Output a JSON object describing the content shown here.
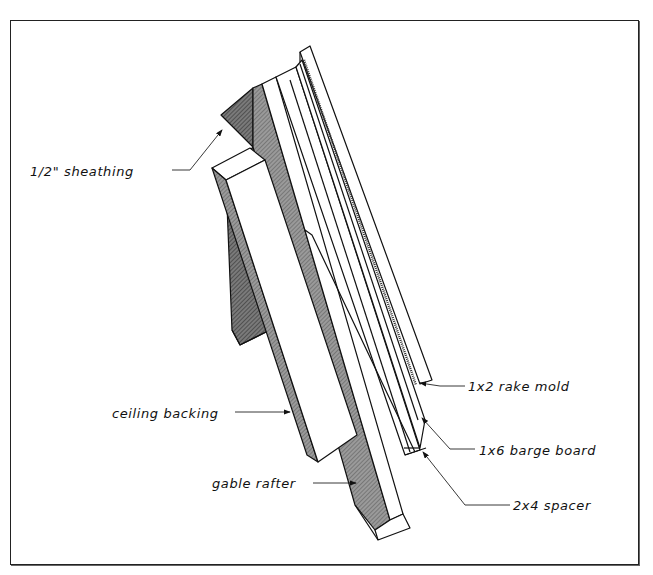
{
  "diagram": {
    "type": "exploded framing detail (gable rake)",
    "labels": [
      {
        "id": "sheathing",
        "text": "1/2\" sheathing"
      },
      {
        "id": "ceiling_backing",
        "text": "ceiling backing"
      },
      {
        "id": "gable_rafter",
        "text": "gable rafter"
      },
      {
        "id": "rake_mold",
        "text": "1x2 rake mold"
      },
      {
        "id": "barge_board",
        "text": "1x6 barge board"
      },
      {
        "id": "spacer",
        "text": "2x4 spacer"
      }
    ],
    "colors": {
      "line": "#111111",
      "shade": "#8a8a8a",
      "dark_shade": "#6e6e6e",
      "face": "#ffffff"
    }
  }
}
